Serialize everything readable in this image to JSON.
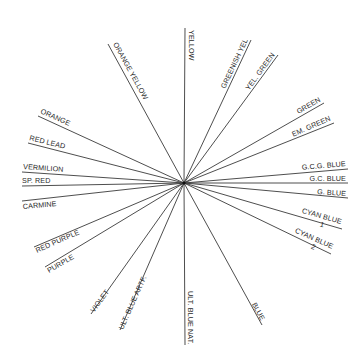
{
  "diagram": {
    "type": "radial-color-wheel-spokes",
    "center": {
      "x": 184,
      "y": 183
    },
    "line_color": "#3a3a3a",
    "text_color": "#2a2a2a",
    "background": "#ffffff",
    "spokes": [
      {
        "id": "yellow",
        "label": "YELLOW",
        "x2": 185,
        "y2": 28,
        "lx": 189,
        "ly": 30,
        "rot": 90,
        "anchor": "start"
      },
      {
        "id": "orange-yellow",
        "label": "ORANGE YELLOW",
        "x2": 108,
        "y2": 44,
        "lx": 113,
        "ly": 44,
        "rot": 61,
        "anchor": "start"
      },
      {
        "id": "greenish-yel",
        "label": "GREENISH YEL",
        "x2": 251,
        "y2": 40,
        "lx": 248,
        "ly": 40,
        "rot": -65,
        "anchor": "end"
      },
      {
        "id": "yel-green",
        "label": "YEL. GREEN",
        "x2": 278,
        "y2": 55,
        "lx": 275,
        "ly": 55,
        "rot": -54,
        "anchor": "end"
      },
      {
        "id": "green",
        "label": "GREEN",
        "x2": 324,
        "y2": 103,
        "lx": 321,
        "ly": 101,
        "rot": -30,
        "anchor": "end"
      },
      {
        "id": "em-green",
        "label": "EM. GREEN",
        "x2": 334,
        "y2": 123,
        "lx": 331,
        "ly": 120,
        "rot": -24,
        "anchor": "end"
      },
      {
        "id": "gcg-blue",
        "label": "G.C.G. BLUE",
        "x2": 348,
        "y2": 169,
        "lx": 346,
        "ly": 166,
        "rot": -5,
        "anchor": "end"
      },
      {
        "id": "gc-blue",
        "label": "G.C. BLUE",
        "x2": 348,
        "y2": 183,
        "lx": 346,
        "ly": 181,
        "rot": 0,
        "anchor": "end"
      },
      {
        "id": "g-blue",
        "label": "G. BLUE",
        "x2": 348,
        "y2": 198,
        "lx": 346,
        "ly": 196,
        "rot": 4,
        "anchor": "end"
      },
      {
        "id": "cyan-blue-1",
        "label": "CYAN BLUE",
        "sub": "1",
        "x2": 342,
        "y2": 229,
        "lx": 341,
        "ly": 224,
        "rot": 16,
        "anchor": "end"
      },
      {
        "id": "cyan-blue-2",
        "label": "CYAN BLUE",
        "sub": "2",
        "x2": 331,
        "y2": 254,
        "lx": 332,
        "ly": 249,
        "rot": 24,
        "anchor": "end"
      },
      {
        "id": "blue",
        "label": "BLUE",
        "x2": 262,
        "y2": 325,
        "lx": 261,
        "ly": 321,
        "rot": 61,
        "anchor": "end"
      },
      {
        "id": "ult-blue-nat",
        "label": "ULT. BLUE NAT.",
        "x2": 185,
        "y2": 345,
        "lx": 188,
        "ly": 291,
        "rot": 90,
        "anchor": "start"
      },
      {
        "id": "ult-blue-artf",
        "label": "ULT. BLUE ARTF.",
        "x2": 120,
        "y2": 330,
        "lx": 123,
        "ly": 330,
        "rot": -66,
        "anchor": "start"
      },
      {
        "id": "violet",
        "label": "VIOLET",
        "x2": 91,
        "y2": 314,
        "lx": 94,
        "ly": 313,
        "rot": -54,
        "anchor": "start"
      },
      {
        "id": "purple",
        "label": "PURPLE",
        "x2": 45,
        "y2": 267,
        "lx": 49,
        "ly": 273,
        "rot": -30,
        "anchor": "start"
      },
      {
        "id": "red-purple",
        "label": "RED PURPLE",
        "x2": 34,
        "y2": 247,
        "lx": 37,
        "ly": 253,
        "rot": -24,
        "anchor": "start"
      },
      {
        "id": "carmine",
        "label": "CARMINE",
        "x2": 22,
        "y2": 201,
        "lx": 23,
        "ly": 209,
        "rot": -5,
        "anchor": "start"
      },
      {
        "id": "sp-red",
        "label": "SP. RED",
        "x2": 22,
        "y2": 186,
        "lx": 22,
        "ly": 183,
        "rot": 0,
        "anchor": "start"
      },
      {
        "id": "vermilion",
        "label": "VERMILION",
        "x2": 22,
        "y2": 172,
        "lx": 23,
        "ly": 169,
        "rot": 4,
        "anchor": "start"
      },
      {
        "id": "red-lead",
        "label": "RED LEAD",
        "x2": 28,
        "y2": 143,
        "lx": 29,
        "ly": 140,
        "rot": 14,
        "anchor": "start"
      },
      {
        "id": "orange",
        "label": "ORANGE",
        "x2": 38,
        "y2": 116,
        "lx": 40,
        "ly": 113,
        "rot": 24,
        "anchor": "start"
      }
    ]
  }
}
